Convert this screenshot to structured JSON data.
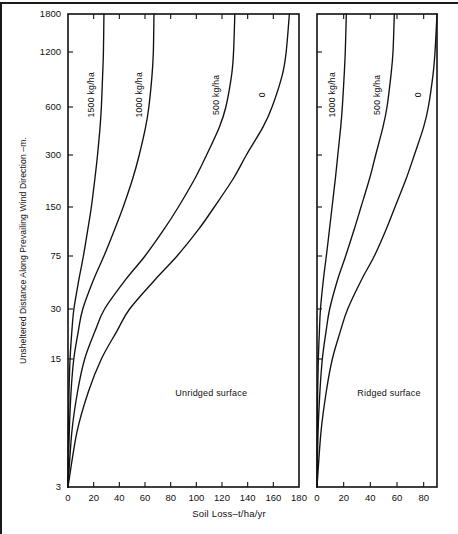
{
  "chart_data": {
    "type": "line",
    "title": "",
    "xlabel": "Soil Loss–t/ha/yr",
    "ylabel": "Unsheltered Distance Along Prevailing Wind Direction –m.",
    "y_ticks": [
      3,
      15,
      30,
      75,
      150,
      300,
      600,
      1200,
      1800
    ],
    "y_tick_labels": [
      "3",
      "15",
      "30",
      "75",
      "150",
      "300",
      "600",
      "1200",
      "1800"
    ],
    "y_scale": "log-like (compressed upper range)",
    "grid": false,
    "legend": "inline curve labels",
    "panels": [
      {
        "name": "Unridged surface",
        "label": "Unridged surface",
        "xlim": [
          0,
          180
        ],
        "x_ticks": [
          0,
          20,
          40,
          60,
          80,
          100,
          120,
          140,
          160,
          180
        ],
        "x_tick_labels": [
          "0",
          "20",
          "40",
          "60",
          "80",
          "100",
          "120",
          "140",
          "160",
          "180"
        ],
        "series": [
          {
            "name": "1500 kg/ha",
            "label": "1500 kg/ha",
            "points": [
              {
                "y": 3,
                "x": 0.0
              },
              {
                "y": 6,
                "x": 0.3
              },
              {
                "y": 10,
                "x": 0.8
              },
              {
                "y": 15,
                "x": 1.6
              },
              {
                "y": 22,
                "x": 3.0
              },
              {
                "y": 30,
                "x": 4.6
              },
              {
                "y": 50,
                "x": 8.5
              },
              {
                "y": 75,
                "x": 12.0
              },
              {
                "y": 110,
                "x": 15.5
              },
              {
                "y": 150,
                "x": 18.2
              },
              {
                "y": 220,
                "x": 21.0
              },
              {
                "y": 300,
                "x": 23.0
              },
              {
                "y": 450,
                "x": 25.0
              },
              {
                "y": 600,
                "x": 26.0
              },
              {
                "y": 900,
                "x": 27.0
              },
              {
                "y": 1200,
                "x": 27.6
              },
              {
                "y": 1800,
                "x": 28.0
              }
            ]
          },
          {
            "name": "1000 kg/ha",
            "label": "1000 kg/ha",
            "points": [
              {
                "y": 3,
                "x": 0.0
              },
              {
                "y": 6,
                "x": 1.0
              },
              {
                "y": 10,
                "x": 2.4
              },
              {
                "y": 15,
                "x": 4.5
              },
              {
                "y": 22,
                "x": 8.0
              },
              {
                "y": 30,
                "x": 11.5
              },
              {
                "y": 50,
                "x": 20.0
              },
              {
                "y": 75,
                "x": 28.0
              },
              {
                "y": 110,
                "x": 36.5
              },
              {
                "y": 150,
                "x": 43.0
              },
              {
                "y": 220,
                "x": 50.5
              },
              {
                "y": 300,
                "x": 55.5
              },
              {
                "y": 450,
                "x": 60.5
              },
              {
                "y": 600,
                "x": 63.0
              },
              {
                "y": 900,
                "x": 65.5
              },
              {
                "y": 1200,
                "x": 66.5
              },
              {
                "y": 1800,
                "x": 67.0
              }
            ]
          },
          {
            "name": "500 kg/ha",
            "label": "500 kg/ha",
            "points": [
              {
                "y": 3,
                "x": 0.0
              },
              {
                "y": 6,
                "x": 3.0
              },
              {
                "y": 10,
                "x": 7.5
              },
              {
                "y": 15,
                "x": 13.0
              },
              {
                "y": 22,
                "x": 21.0
              },
              {
                "y": 30,
                "x": 28.5
              },
              {
                "y": 50,
                "x": 45.0
              },
              {
                "y": 75,
                "x": 60.0
              },
              {
                "y": 110,
                "x": 75.0
              },
              {
                "y": 150,
                "x": 86.0
              },
              {
                "y": 220,
                "x": 99.0
              },
              {
                "y": 300,
                "x": 108.0
              },
              {
                "y": 450,
                "x": 118.0
              },
              {
                "y": 600,
                "x": 123.0
              },
              {
                "y": 900,
                "x": 127.5
              },
              {
                "y": 1200,
                "x": 129.0
              },
              {
                "y": 1800,
                "x": 130.0
              }
            ]
          },
          {
            "name": "0",
            "label": "0",
            "points": [
              {
                "y": 3,
                "x": 0.0
              },
              {
                "y": 6,
                "x": 7.0
              },
              {
                "y": 10,
                "x": 16.0
              },
              {
                "y": 15,
                "x": 26.0
              },
              {
                "y": 22,
                "x": 38.0
              },
              {
                "y": 30,
                "x": 48.0
              },
              {
                "y": 50,
                "x": 68.0
              },
              {
                "y": 75,
                "x": 85.0
              },
              {
                "y": 110,
                "x": 102.0
              },
              {
                "y": 150,
                "x": 114.0
              },
              {
                "y": 220,
                "x": 129.0
              },
              {
                "y": 300,
                "x": 139.0
              },
              {
                "y": 450,
                "x": 152.0
              },
              {
                "y": 600,
                "x": 159.0
              },
              {
                "y": 900,
                "x": 167.0
              },
              {
                "y": 1200,
                "x": 170.0
              },
              {
                "y": 1800,
                "x": 172.5
              }
            ]
          }
        ]
      },
      {
        "name": "Ridged surface",
        "label": "Ridged surface",
        "xlim": [
          0,
          90
        ],
        "x_ticks": [
          0,
          20,
          40,
          60,
          80
        ],
        "x_tick_labels": [
          "0",
          "20",
          "40",
          "60",
          "80"
        ],
        "series": [
          {
            "name": "1000 kg/ha",
            "label": "1000 kg/ha",
            "points": [
              {
                "y": 3,
                "x": 0.0
              },
              {
                "y": 6,
                "x": 0.2
              },
              {
                "y": 10,
                "x": 0.5
              },
              {
                "y": 15,
                "x": 1.0
              },
              {
                "y": 22,
                "x": 1.8
              },
              {
                "y": 30,
                "x": 2.6
              },
              {
                "y": 50,
                "x": 4.8
              },
              {
                "y": 75,
                "x": 7.0
              },
              {
                "y": 110,
                "x": 9.4
              },
              {
                "y": 150,
                "x": 11.3
              },
              {
                "y": 220,
                "x": 13.8
              },
              {
                "y": 300,
                "x": 15.6
              },
              {
                "y": 450,
                "x": 17.8
              },
              {
                "y": 600,
                "x": 19.0
              },
              {
                "y": 900,
                "x": 20.4
              },
              {
                "y": 1200,
                "x": 21.2
              },
              {
                "y": 1800,
                "x": 22.0
              }
            ]
          },
          {
            "name": "500 kg/ha",
            "label": "500 kg/ha",
            "points": [
              {
                "y": 3,
                "x": 0.0
              },
              {
                "y": 6,
                "x": 0.8
              },
              {
                "y": 10,
                "x": 2.2
              },
              {
                "y": 15,
                "x": 4.0
              },
              {
                "y": 22,
                "x": 6.8
              },
              {
                "y": 30,
                "x": 9.5
              },
              {
                "y": 50,
                "x": 15.5
              },
              {
                "y": 75,
                "x": 21.5
              },
              {
                "y": 110,
                "x": 28.0
              },
              {
                "y": 150,
                "x": 33.0
              },
              {
                "y": 220,
                "x": 39.5
              },
              {
                "y": 300,
                "x": 44.0
              },
              {
                "y": 450,
                "x": 49.5
              },
              {
                "y": 600,
                "x": 52.5
              },
              {
                "y": 900,
                "x": 55.5
              },
              {
                "y": 1200,
                "x": 57.0
              },
              {
                "y": 1800,
                "x": 58.0
              }
            ]
          },
          {
            "name": "0",
            "label": "0",
            "points": [
              {
                "y": 3,
                "x": 0.0
              },
              {
                "y": 6,
                "x": 3.0
              },
              {
                "y": 10,
                "x": 7.0
              },
              {
                "y": 15,
                "x": 11.5
              },
              {
                "y": 22,
                "x": 17.5
              },
              {
                "y": 30,
                "x": 23.0
              },
              {
                "y": 50,
                "x": 33.5
              },
              {
                "y": 75,
                "x": 43.0
              },
              {
                "y": 110,
                "x": 52.0
              },
              {
                "y": 150,
                "x": 58.5
              },
              {
                "y": 220,
                "x": 67.0
              },
              {
                "y": 300,
                "x": 73.0
              },
              {
                "y": 450,
                "x": 80.0
              },
              {
                "y": 600,
                "x": 83.5
              },
              {
                "y": 900,
                "x": 87.0
              },
              {
                "y": 1200,
                "x": 88.5
              },
              {
                "y": 1800,
                "x": 90.0
              }
            ]
          }
        ]
      }
    ]
  },
  "axes": {
    "x_title": "Soil Loss–t/ha/yr",
    "y_title": "Unsheltered Distance Along Prevailing Wind Direction –m."
  }
}
